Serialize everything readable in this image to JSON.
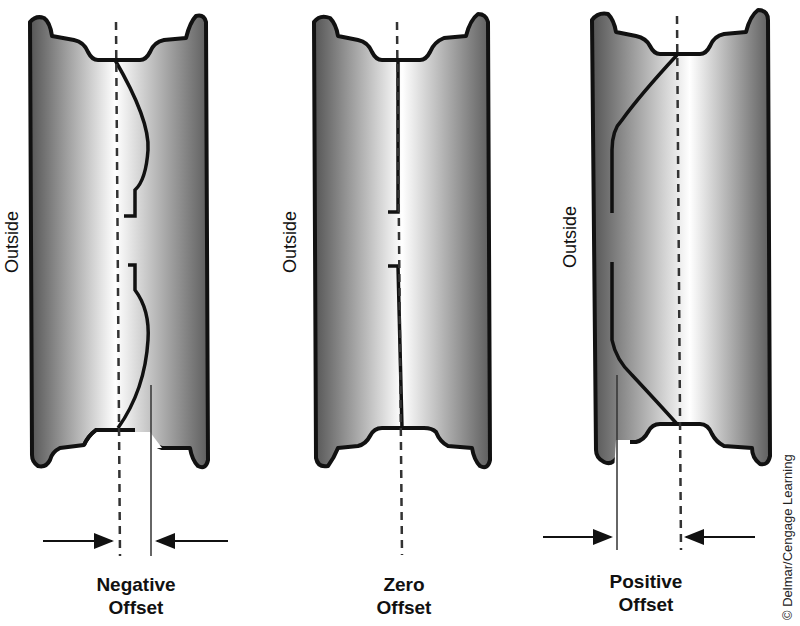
{
  "diagram": {
    "wheels": [
      {
        "id": "negative",
        "side_label": "Outside",
        "caption_line1": "Negative",
        "caption_line2": "Offset",
        "centerline_x": 118,
        "mount_face_x": 150,
        "offset_direction": "mounting face inboard of centerline"
      },
      {
        "id": "zero",
        "side_label": "Outside",
        "caption_line1": "Zero",
        "caption_line2": "Offset",
        "centerline_x": 401,
        "mount_face_x": 401,
        "offset_direction": "mounting face on centerline"
      },
      {
        "id": "positive",
        "side_label": "Outside",
        "caption_line1": "Positive",
        "caption_line2": "Offset",
        "centerline_x": 680,
        "mount_face_x": 617,
        "offset_direction": "mounting face outboard of centerline"
      }
    ],
    "credit": "© Delmar/Cengage Learning",
    "colors": {
      "rim_dark": "#5a5a5a",
      "rim_light": "#ffffff",
      "outline": "#111111",
      "background": "#ffffff"
    }
  }
}
